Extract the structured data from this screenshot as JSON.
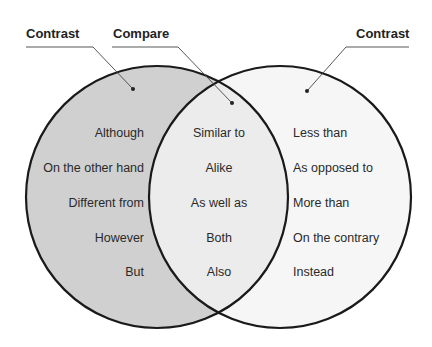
{
  "headers": {
    "left": "Contrast",
    "middle": "Compare",
    "right": "Contrast"
  },
  "left_set": {
    "items": [
      "Although",
      "On the other hand",
      "Different from",
      "However",
      "But"
    ],
    "fill": "#d0d0d0"
  },
  "intersection": {
    "items": [
      "Similar to",
      "Alike",
      "As well as",
      "Both",
      "Also"
    ],
    "fill": "#ececec"
  },
  "right_set": {
    "items": [
      "Less than",
      "As opposed to",
      "More than",
      "On the contrary",
      "Instead"
    ],
    "fill": "#f6f6f6"
  },
  "colors": {
    "outline": "#1a1a1a",
    "leader": "#444444",
    "text": "#2a2a2a"
  }
}
